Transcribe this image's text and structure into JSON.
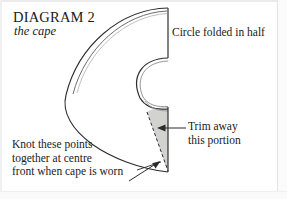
{
  "figure": {
    "title": "DIAGRAM 2",
    "subtitle": "the cape",
    "type": "sewing-pattern-diagram"
  },
  "annotations": {
    "fold_label": "Circle folded in half",
    "trim_label_line1": "Trim away",
    "trim_label_line2": "this portion",
    "knot_label_line1": "Knot these points",
    "knot_label_line2": "together at centre",
    "knot_label_line3": "front when cape is worn"
  },
  "colors": {
    "ink": "#1a1a1a",
    "line": "#3a3a3a",
    "shade_fill": "#d2d2d0",
    "paper": "#ffffff"
  }
}
